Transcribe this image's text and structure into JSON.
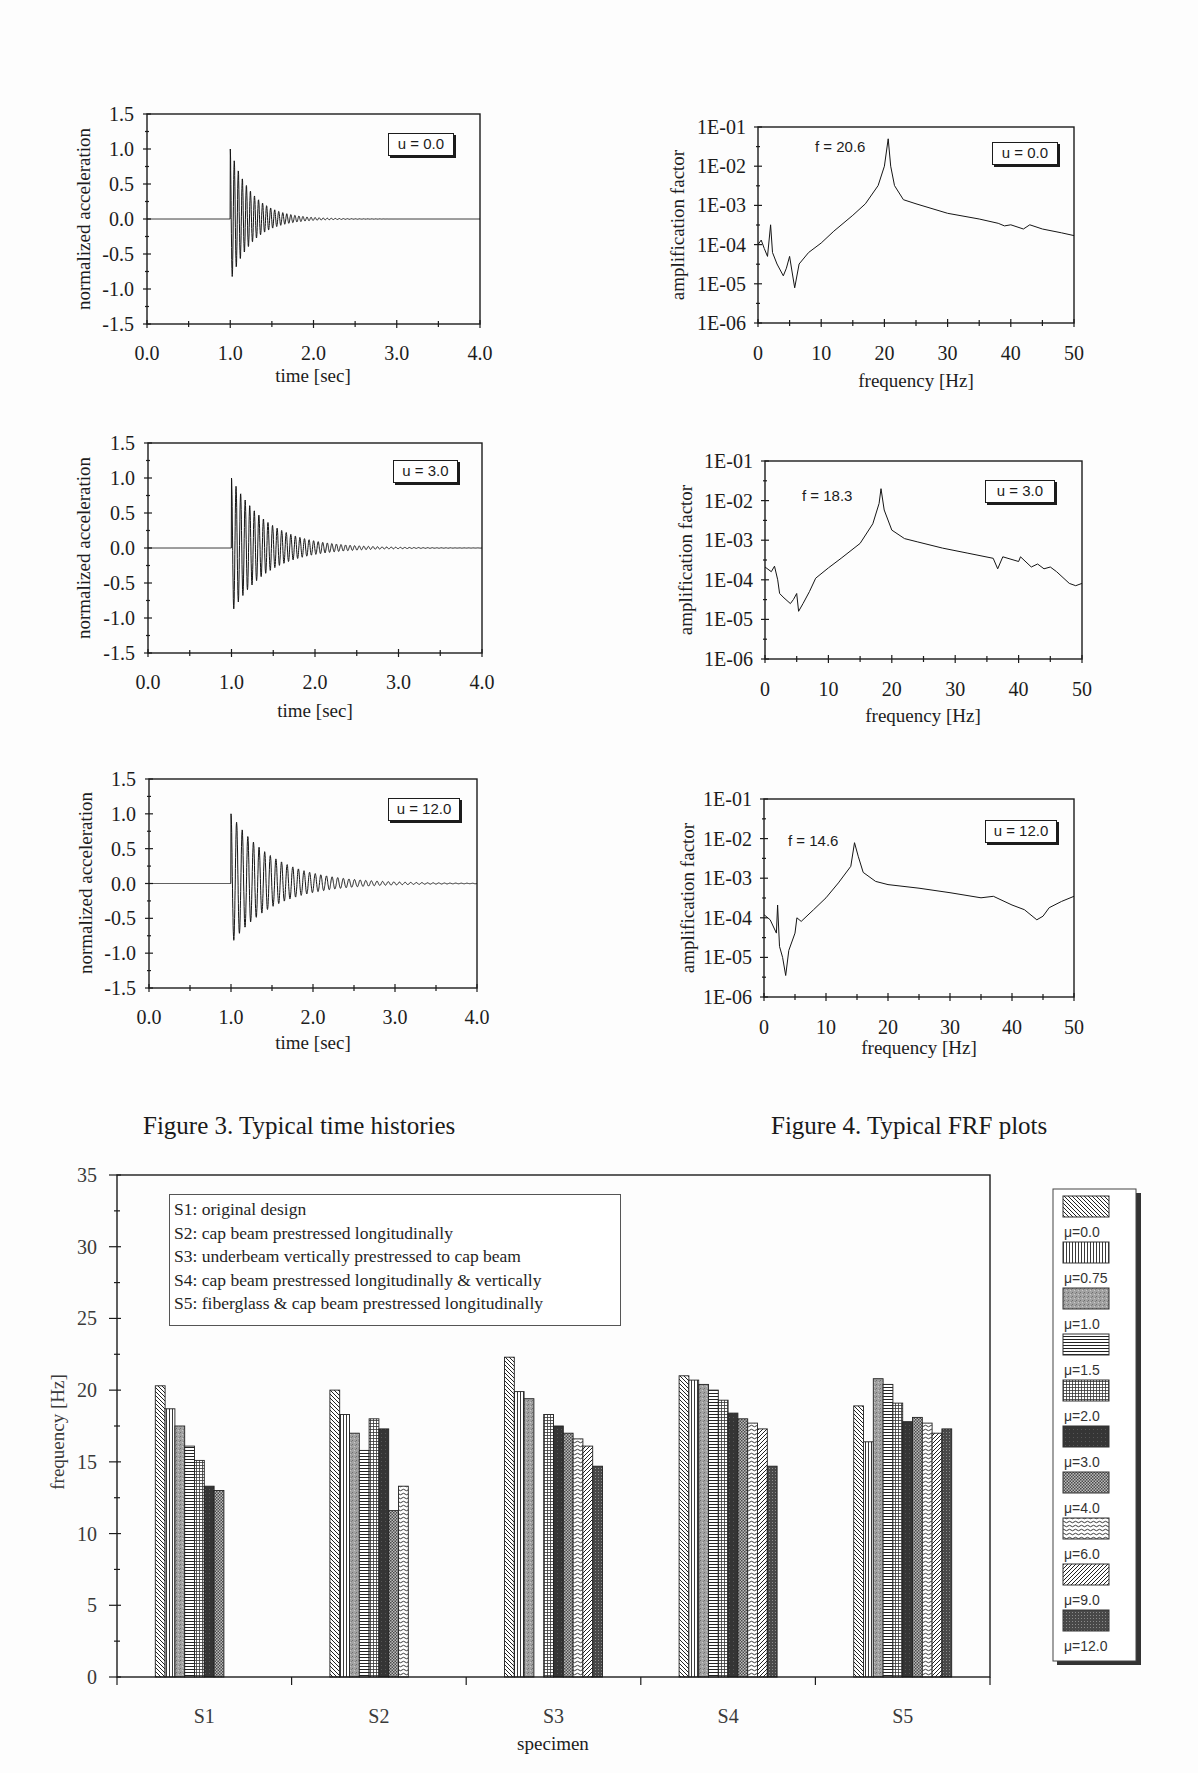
{
  "captions": {
    "figure3": "Figure 3. Typical time histories",
    "figure4": "Figure 4. Typical FRF plots"
  },
  "chart_data": [
    {
      "type": "line",
      "title": "",
      "xlabel": "time [sec]",
      "ylabel": "normalized acceleration",
      "xlim": [
        0,
        4
      ],
      "ylim": [
        -1.5,
        1.5
      ],
      "xticks": [
        0,
        1,
        2,
        3,
        4
      ],
      "xtick_labels": [
        "0.0",
        "1.0",
        "2.0",
        "3.0",
        "4.0"
      ],
      "yticks": [
        1.5,
        1,
        0.5,
        0,
        -0.5,
        -1,
        -1.5
      ],
      "ytick_labels": [
        "1.5",
        "1.0",
        "0.5",
        "0.0",
        "-0.5",
        "-1.0",
        "-1.5"
      ],
      "annotation": "u = 0.0",
      "grid": false,
      "legend": "none",
      "series": [
        {
          "name": "normalized acceleration",
          "onset_sec": 1.0,
          "peak_positive": 1.0,
          "peak_negative": -0.9,
          "oscillation_hz": 20.6,
          "decay_rate": 3.8,
          "settled_by_sec": 1.9
        }
      ]
    },
    {
      "type": "line",
      "title": "",
      "xlabel": "time [sec]",
      "ylabel": "normalized acceleration",
      "xlim": [
        0,
        4
      ],
      "ylim": [
        -1.5,
        1.5
      ],
      "xticks": [
        0,
        1,
        2,
        3,
        4
      ],
      "xtick_labels": [
        "0.0",
        "1.0",
        "2.0",
        "3.0",
        "4.0"
      ],
      "yticks": [
        1.5,
        1,
        0.5,
        0,
        -0.5,
        -1,
        -1.5
      ],
      "ytick_labels": [
        "1.5",
        "1.0",
        "0.5",
        "0.0",
        "-0.5",
        "-1.0",
        "-1.5"
      ],
      "annotation": "u = 3.0",
      "grid": false,
      "legend": "none",
      "series": [
        {
          "name": "normalized acceleration",
          "onset_sec": 1.0,
          "peak_positive": 1.0,
          "peak_negative": -0.93,
          "oscillation_hz": 18.3,
          "decay_rate": 2.3,
          "settled_by_sec": 2.6
        }
      ]
    },
    {
      "type": "line",
      "title": "",
      "xlabel": "time [sec]",
      "ylabel": "normalized acceleration",
      "xlim": [
        0,
        4
      ],
      "ylim": [
        -1.5,
        1.5
      ],
      "xticks": [
        0,
        1,
        2,
        3,
        4
      ],
      "xtick_labels": [
        "0.0",
        "1.0",
        "2.0",
        "3.0",
        "4.0"
      ],
      "yticks": [
        1.5,
        1,
        0.5,
        0,
        -0.5,
        -1,
        -1.5
      ],
      "ytick_labels": [
        "1.5",
        "1.0",
        "0.5",
        "0.0",
        "-0.5",
        "-1.0",
        "-1.5"
      ],
      "annotation": "u = 12.0",
      "grid": false,
      "legend": "none",
      "series": [
        {
          "name": "normalized acceleration",
          "onset_sec": 1.0,
          "peak_positive": 1.0,
          "peak_negative": -0.87,
          "oscillation_hz": 14.6,
          "decay_rate": 1.9,
          "settled_by_sec": 3.3
        }
      ]
    },
    {
      "type": "line",
      "yscale": "log",
      "title": "",
      "xlabel": "frequency [Hz]",
      "ylabel": "amplification factor",
      "xlim": [
        0,
        50
      ],
      "ylim": [
        1e-06,
        0.1
      ],
      "xticks": [
        0,
        10,
        20,
        30,
        40,
        50
      ],
      "xtick_labels": [
        "0",
        "10",
        "20",
        "30",
        "40",
        "50"
      ],
      "yticks": [
        0.1,
        0.01,
        0.001,
        0.0001,
        1e-05,
        1e-06
      ],
      "ytick_labels": [
        "1E-01",
        "1E-02",
        "1E-03",
        "1E-04",
        "1E-05",
        "1E-06"
      ],
      "annotation": "u = 0.0",
      "peak_label": "f = 20.6",
      "grid": false,
      "legend": "none",
      "series": [
        {
          "name": "FRF",
          "peak_hz": 20.6,
          "points": [
            [
              0,
              0.0001
            ],
            [
              0.5,
              0.00013
            ],
            [
              1,
              7.9e-05
            ],
            [
              1.5,
              5e-05
            ],
            [
              2,
              0.00032
            ],
            [
              2.3,
              6.3e-05
            ],
            [
              3,
              3.2e-05
            ],
            [
              4,
              1.6e-05
            ],
            [
              4.5,
              2.5e-05
            ],
            [
              5,
              5e-05
            ],
            [
              5.4,
              2e-05
            ],
            [
              5.8,
              7.9e-06
            ],
            [
              6.5,
              3.2e-05
            ],
            [
              8,
              6.3e-05
            ],
            [
              10,
              0.00011
            ],
            [
              12,
              0.00022
            ],
            [
              15,
              0.00056
            ],
            [
              17,
              0.0011
            ],
            [
              19,
              0.0032
            ],
            [
              20,
              0.01
            ],
            [
              20.6,
              0.05
            ],
            [
              21,
              0.01
            ],
            [
              21.6,
              0.0032
            ],
            [
              23,
              0.0014
            ],
            [
              25,
              0.0011
            ],
            [
              30,
              0.00063
            ],
            [
              35,
              0.00045
            ],
            [
              38,
              0.00035
            ],
            [
              39,
              0.0003
            ],
            [
              40,
              0.00032
            ],
            [
              42,
              0.00025
            ],
            [
              43,
              0.00032
            ],
            [
              45,
              0.00025
            ],
            [
              48,
              0.0002
            ],
            [
              50,
              0.00017
            ]
          ]
        }
      ]
    },
    {
      "type": "line",
      "yscale": "log",
      "title": "",
      "xlabel": "frequency [Hz]",
      "ylabel": "amplification factor",
      "xlim": [
        0,
        50
      ],
      "ylim": [
        1e-06,
        0.1
      ],
      "xticks": [
        0,
        10,
        20,
        30,
        40,
        50
      ],
      "xtick_labels": [
        "0",
        "10",
        "20",
        "30",
        "40",
        "50"
      ],
      "yticks": [
        0.1,
        0.01,
        0.001,
        0.0001,
        1e-05,
        1e-06
      ],
      "ytick_labels": [
        "1E-01",
        "1E-02",
        "1E-03",
        "1E-04",
        "1E-05",
        "1E-06"
      ],
      "annotation": "u = 3.0",
      "peak_label": "f = 18.3",
      "grid": false,
      "legend": "none",
      "series": [
        {
          "name": "FRF",
          "peak_hz": 18.3,
          "points": [
            [
              0,
              0.00021
            ],
            [
              1,
              0.00016
            ],
            [
              1.5,
              0.00022
            ],
            [
              2,
              0.0001
            ],
            [
              2.3,
              4.5e-05
            ],
            [
              3,
              3.5e-05
            ],
            [
              4,
              2.5e-05
            ],
            [
              4.5,
              3.2e-05
            ],
            [
              5,
              4.5e-05
            ],
            [
              5.3,
              1.6e-05
            ],
            [
              6,
              2.5e-05
            ],
            [
              7,
              5e-05
            ],
            [
              8,
              0.00011
            ],
            [
              10,
              0.0002
            ],
            [
              12,
              0.00035
            ],
            [
              15,
              0.00083
            ],
            [
              17,
              0.0026
            ],
            [
              18,
              0.0085
            ],
            [
              18.3,
              0.02
            ],
            [
              18.8,
              0.0058
            ],
            [
              20,
              0.0018
            ],
            [
              22,
              0.0011
            ],
            [
              24,
              0.00091
            ],
            [
              28,
              0.00063
            ],
            [
              32,
              0.00047
            ],
            [
              36,
              0.00035
            ],
            [
              36.7,
              0.00019
            ],
            [
              37.5,
              0.00038
            ],
            [
              40,
              0.00029
            ],
            [
              40.3,
              0.00038
            ],
            [
              42,
              0.00021
            ],
            [
              43,
              0.00025
            ],
            [
              44,
              0.00019
            ],
            [
              45,
              0.00021
            ],
            [
              46,
              0.00016
            ],
            [
              48,
              8.1e-05
            ],
            [
              49,
              7.1e-05
            ],
            [
              50,
              8.1e-05
            ]
          ]
        }
      ]
    },
    {
      "type": "line",
      "yscale": "log",
      "title": "",
      "xlabel": "frequency [Hz]",
      "ylabel": "amplification factor",
      "xlim": [
        0,
        50
      ],
      "ylim": [
        1e-06,
        0.1
      ],
      "xticks": [
        0,
        10,
        20,
        30,
        40,
        50
      ],
      "xtick_labels": [
        "0",
        "10",
        "20",
        "30",
        "40",
        "50"
      ],
      "yticks": [
        0.1,
        0.01,
        0.001,
        0.0001,
        1e-05,
        1e-06
      ],
      "ytick_labels": [
        "1E-01",
        "1E-02",
        "1E-03",
        "1E-04",
        "1E-05",
        "1E-06"
      ],
      "annotation": "u = 12.0",
      "peak_label": "f = 14.6",
      "grid": false,
      "legend": "none",
      "series": [
        {
          "name": "FRF",
          "peak_hz": 14.6,
          "points": [
            [
              0,
              0.00012
            ],
            [
              1,
              8.9e-05
            ],
            [
              2,
              4.1e-05
            ],
            [
              2.2,
              0.00021
            ],
            [
              2.5,
              1.9e-05
            ],
            [
              3,
              1e-05
            ],
            [
              3.5,
              3.5e-06
            ],
            [
              4,
              1.5e-05
            ],
            [
              5,
              4.1e-05
            ],
            [
              5.3,
              0.0001
            ],
            [
              6,
              8.1e-05
            ],
            [
              8,
              0.00016
            ],
            [
              10,
              0.00032
            ],
            [
              12,
              0.00076
            ],
            [
              14,
              0.002
            ],
            [
              14.6,
              0.0079
            ],
            [
              15.2,
              0.0036
            ],
            [
              16,
              0.0014
            ],
            [
              18,
              0.00083
            ],
            [
              20,
              0.00069
            ],
            [
              25,
              0.00056
            ],
            [
              30,
              0.00043
            ],
            [
              35,
              0.00032
            ],
            [
              37,
              0.00035
            ],
            [
              40,
              0.00021
            ],
            [
              42,
              0.00016
            ],
            [
              44,
              8.9e-05
            ],
            [
              45,
              0.00011
            ],
            [
              46,
              0.00018
            ],
            [
              48,
              0.00026
            ],
            [
              50,
              0.00035
            ]
          ]
        }
      ]
    },
    {
      "type": "bar",
      "title": "",
      "xlabel": "specimen",
      "ylabel": "frequency [Hz]",
      "ylim": [
        0,
        35
      ],
      "yticks": [
        35,
        30,
        25,
        20,
        15,
        10,
        5,
        0
      ],
      "ytick_labels": [
        "35",
        "30",
        "25",
        "20",
        "15",
        "10",
        "5",
        "0"
      ],
      "categories": [
        "S1",
        "S2",
        "S3",
        "S4",
        "S5"
      ],
      "grid": false,
      "legend_position": "right",
      "annotation_lines": [
        "S1: original design",
        "S2: cap beam prestressed longitudinally",
        "S3: underbeam vertically prestressed to cap beam",
        "S4: cap beam prestressed longitudinally & vertically",
        "S5: fiberglass & cap beam prestressed longitudinally"
      ],
      "series": [
        {
          "name": "μ=0.0",
          "pattern": "diagonal-hatch-down",
          "values": [
            20.3,
            20.0,
            22.3,
            21.0,
            18.9
          ]
        },
        {
          "name": "μ=0.75",
          "pattern": "vertical-lines",
          "values": [
            18.7,
            18.3,
            19.9,
            20.7,
            16.4
          ]
        },
        {
          "name": "μ=1.0",
          "pattern": "gray-stipple",
          "values": [
            17.5,
            17.0,
            19.4,
            20.4,
            20.8
          ]
        },
        {
          "name": "μ=1.5",
          "pattern": "horizontal-lines",
          "values": [
            16.1,
            15.8,
            null,
            20.0,
            20.4
          ]
        },
        {
          "name": "μ=2.0",
          "pattern": "grid",
          "values": [
            15.1,
            18.0,
            18.3,
            19.3,
            19.1
          ]
        },
        {
          "name": "μ=3.0",
          "pattern": "dark-solid",
          "values": [
            13.3,
            17.3,
            17.5,
            18.4,
            17.8
          ]
        },
        {
          "name": "μ=4.0",
          "pattern": "crosshatch-dots",
          "values": [
            13.0,
            11.6,
            17.0,
            18.0,
            18.1
          ]
        },
        {
          "name": "μ=6.0",
          "pattern": "wavy-lines",
          "values": [
            null,
            13.3,
            16.6,
            17.7,
            17.7
          ]
        },
        {
          "name": "μ=9.0",
          "pattern": "diagonal-hatch-up",
          "values": [
            null,
            null,
            16.1,
            17.3,
            17.0
          ]
        },
        {
          "name": "μ=12.0",
          "pattern": "dark-dotted",
          "values": [
            null,
            null,
            14.7,
            14.7,
            17.3
          ]
        }
      ]
    }
  ]
}
